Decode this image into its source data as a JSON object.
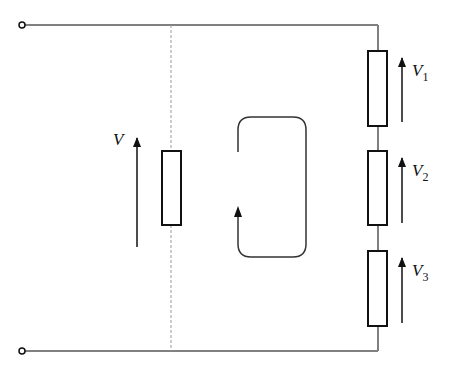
{
  "diagram": {
    "type": "series-circuit-kvl",
    "source_label": "V",
    "resistors": [
      {
        "label": "V",
        "sub": "1"
      },
      {
        "label": "V",
        "sub": "2"
      },
      {
        "label": "V",
        "sub": "3"
      }
    ],
    "colors": {
      "wire": "#808080",
      "component": "#111111",
      "dashed": "#999999"
    }
  }
}
